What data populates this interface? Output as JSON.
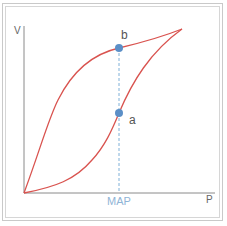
{
  "diagram": {
    "type": "pressure-volume hysteresis loop",
    "axes": {
      "y_label": "V",
      "x_label": "P",
      "x_marker_label": "MAP"
    },
    "points": [
      {
        "label": "b",
        "description": "upper (deflation) curve at MAP"
      },
      {
        "label": "a",
        "description": "lower (inflation) curve at MAP"
      }
    ],
    "colors": {
      "curve": "#d9534f",
      "point": "#5b8fc7",
      "dashed_line": "#7fb0d8",
      "axis": "#8a8a8a",
      "marker_label": "#8fb4d6",
      "text": "#555555"
    }
  }
}
